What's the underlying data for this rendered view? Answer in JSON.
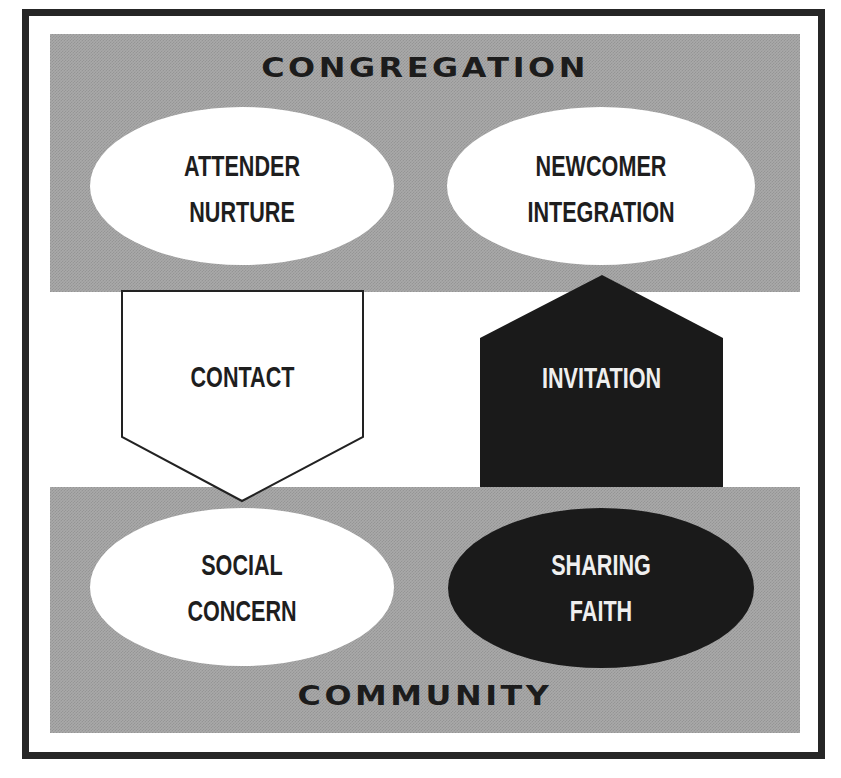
{
  "diagram": {
    "colors": {
      "frame": "#262626",
      "band_gray": "#a9a9a9",
      "shape_white": "#ffffff",
      "shape_black": "#1a1a1a",
      "text_dark": "#1e1e1e",
      "text_light": "#efefef"
    },
    "regions": {
      "top": {
        "title": "CONGREGATION"
      },
      "bottom": {
        "title": "COMMUNITY"
      }
    },
    "nodes": {
      "attender_nurture": {
        "lines": [
          "ATTENDER",
          "NURTURE"
        ],
        "shape": "ellipse",
        "fill": "white"
      },
      "newcomer_integration": {
        "lines": [
          "NEWCOMER",
          "INTEGRATION"
        ],
        "shape": "ellipse",
        "fill": "white"
      },
      "social_concern": {
        "lines": [
          "SOCIAL",
          "CONCERN"
        ],
        "shape": "ellipse",
        "fill": "white"
      },
      "sharing_faith": {
        "lines": [
          "SHARING",
          "FAITH"
        ],
        "shape": "ellipse",
        "fill": "black"
      }
    },
    "arrows": {
      "contact": {
        "label": "CONTACT",
        "direction": "down",
        "fill": "white"
      },
      "invitation": {
        "label": "INVITATION",
        "direction": "up",
        "fill": "black"
      }
    }
  }
}
